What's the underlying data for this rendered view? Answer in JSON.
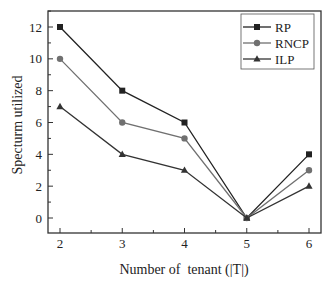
{
  "chart_data": {
    "type": "line",
    "title": "",
    "xlabel": "Number of  tenant (|T|)",
    "ylabel": "Specturm utilized",
    "x": [
      2,
      3,
      4,
      5,
      6
    ],
    "categories": [
      "2",
      "3",
      "4",
      "5",
      "6"
    ],
    "series": [
      {
        "name": "RP",
        "values": [
          12,
          8,
          6,
          0,
          4
        ],
        "color": "#222222",
        "marker": "square"
      },
      {
        "name": "RNCP",
        "values": [
          10,
          6,
          5,
          0,
          3
        ],
        "color": "#707070",
        "marker": "circle"
      },
      {
        "name": "ILP",
        "values": [
          7,
          4,
          3,
          0,
          2
        ],
        "color": "#333333",
        "marker": "triangle"
      }
    ],
    "xlim": [
      1.8,
      6.15
    ],
    "ylim": [
      -1,
      13
    ],
    "xticks": [
      2,
      3,
      4,
      5,
      6
    ],
    "yticks": [
      0,
      2,
      4,
      6,
      8,
      10,
      12
    ],
    "grid": false,
    "legend_position": "upper right"
  }
}
